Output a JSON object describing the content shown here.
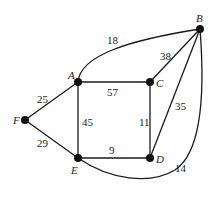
{
  "diagram": {
    "type": "weighted-undirected-graph",
    "vertices": [
      {
        "id": "A",
        "label": "A",
        "x": 78,
        "y": 82,
        "lx": 68,
        "ly": 79
      },
      {
        "id": "B",
        "label": "B",
        "x": 200,
        "y": 29,
        "lx": 196,
        "ly": 22
      },
      {
        "id": "C",
        "label": "C",
        "x": 150,
        "y": 82,
        "lx": 156,
        "ly": 87
      },
      {
        "id": "D",
        "label": "D",
        "x": 150,
        "y": 158,
        "lx": 156,
        "ly": 163
      },
      {
        "id": "E",
        "label": "E",
        "x": 78,
        "y": 158,
        "lx": 71,
        "ly": 174
      },
      {
        "id": "F",
        "label": "F",
        "x": 25,
        "y": 120,
        "lx": 13,
        "ly": 124
      }
    ],
    "edges": [
      {
        "from": "A",
        "to": "B",
        "weight": "18",
        "path": "M78,82 C80,55 130,40 200,29",
        "wx": 107,
        "wy": 44
      },
      {
        "from": "A",
        "to": "C",
        "weight": "57",
        "path": "M78,82 L150,82",
        "wx": 107,
        "wy": 96
      },
      {
        "from": "A",
        "to": "F",
        "weight": "25",
        "path": "M78,82 L25,120",
        "wx": 37,
        "wy": 103
      },
      {
        "from": "A",
        "to": "E",
        "weight": "45",
        "path": "M78,82 L78,158",
        "wx": 82,
        "wy": 126
      },
      {
        "from": "C",
        "to": "B",
        "weight": "38",
        "path": "M150,82 L200,29",
        "wx": 160,
        "wy": 60
      },
      {
        "from": "C",
        "to": "D",
        "weight": "11",
        "path": "M150,82 L150,158",
        "wx": 139,
        "wy": 126
      },
      {
        "from": "D",
        "to": "B",
        "weight": "35",
        "path": "M150,158 L200,29",
        "wx": 175,
        "wy": 110
      },
      {
        "from": "E",
        "to": "D",
        "weight": "9",
        "path": "M78,158 L150,158",
        "wx": 109,
        "wy": 154
      },
      {
        "from": "F",
        "to": "E",
        "weight": "29",
        "path": "M25,120 L78,158",
        "wx": 37,
        "wy": 147
      },
      {
        "from": "E",
        "to": "B",
        "weight": "14",
        "path": "M78,158 C110,180 150,185 175,170 C205,150 204,80 200,29",
        "wx": 175,
        "wy": 172
      }
    ]
  }
}
